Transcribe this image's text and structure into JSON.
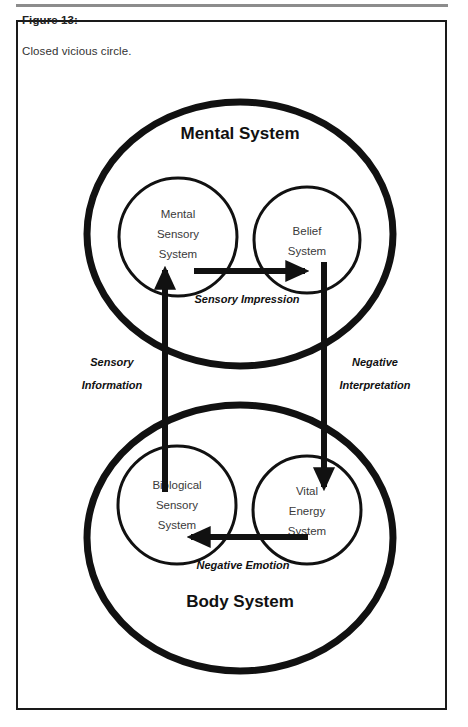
{
  "figure": {
    "label": "Figure 13:",
    "caption": "Closed vicious circle."
  },
  "colors": {
    "stroke": "#111111",
    "frame": "#1a1a1a",
    "rule": "#8c8c8c",
    "background": "#ffffff",
    "sub_text": "#3a3a3a"
  },
  "diagram": {
    "type": "cycle-diagram",
    "containers": [
      {
        "id": "mental-system",
        "title": "Mental System",
        "title_position": "top",
        "children": [
          {
            "id": "mental-sensory-system",
            "lines": [
              "Mental",
              "Sensory",
              "System"
            ]
          },
          {
            "id": "belief-system",
            "lines": [
              "Belief",
              "System"
            ]
          }
        ]
      },
      {
        "id": "body-system",
        "title": "Body System",
        "title_position": "bottom",
        "children": [
          {
            "id": "biological-sensory-system",
            "lines": [
              "Biological",
              "Sensory",
              "System"
            ]
          },
          {
            "id": "vital-energy-system",
            "lines": [
              "Vital",
              "Energy",
              "System"
            ]
          }
        ]
      }
    ],
    "edges": [
      {
        "id": "sensory-impression",
        "label": "Sensory Impression",
        "from": "mental-sensory-system",
        "to": "belief-system",
        "direction": "right",
        "label_lines": [
          "Sensory Impression"
        ]
      },
      {
        "id": "negative-interpretation",
        "label": "Negative Interpretation",
        "from": "belief-system",
        "to": "vital-energy-system",
        "direction": "down",
        "label_lines": [
          "Negative",
          "Interpretation"
        ]
      },
      {
        "id": "negative-emotion",
        "label": "Negative Emotion",
        "from": "vital-energy-system",
        "to": "biological-sensory-system",
        "direction": "left",
        "label_lines": [
          "Negative Emotion"
        ]
      },
      {
        "id": "sensory-information",
        "label": "Sensory Information",
        "from": "biological-sensory-system",
        "to": "mental-sensory-system",
        "direction": "up",
        "label_lines": [
          "Sensory",
          "Information"
        ]
      }
    ]
  }
}
